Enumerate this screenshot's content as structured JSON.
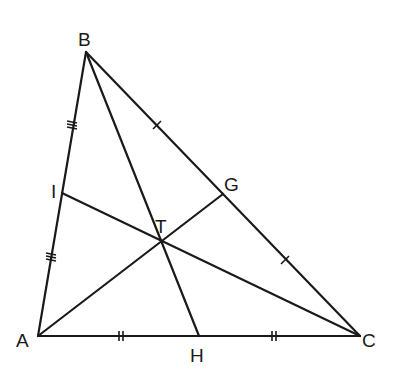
{
  "diagram": {
    "stroke_color": "#1a1a1a",
    "background": "#ffffff",
    "points": {
      "A": {
        "label": "A",
        "x": 38,
        "y": 336
      },
      "B": {
        "label": "B",
        "x": 86,
        "y": 52
      },
      "C": {
        "label": "C",
        "x": 360,
        "y": 336
      },
      "H": {
        "label": "H",
        "x": 199,
        "y": 336
      },
      "G": {
        "label": "G",
        "x": 223,
        "y": 194
      },
      "I": {
        "label": "I",
        "x": 62,
        "y": 193
      },
      "T": {
        "label": "T",
        "x": 160,
        "y": 240
      }
    },
    "segments": [
      [
        "A",
        "B"
      ],
      [
        "B",
        "C"
      ],
      [
        "A",
        "C"
      ],
      [
        "B",
        "H"
      ],
      [
        "A",
        "G"
      ],
      [
        "C",
        "I"
      ]
    ],
    "tick_marks": {
      "AI_IB": "triple",
      "BG_GC": "single",
      "AH_HC": "double"
    }
  }
}
